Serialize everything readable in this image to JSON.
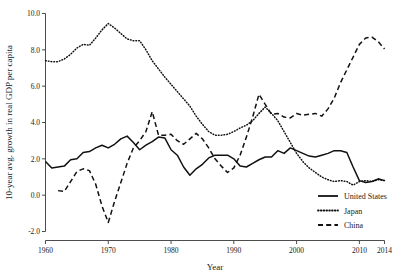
{
  "chart_data": {
    "type": "line",
    "title": "",
    "xlabel": "Year",
    "ylabel": "10-year avg. growth in real GDP per capita",
    "xlim": [
      1960,
      2014
    ],
    "ylim": [
      -2.0,
      10.0
    ],
    "grid": false,
    "legend_position": "bottom-right",
    "xticks": [
      1960,
      1970,
      1980,
      1990,
      2000,
      2010,
      2014
    ],
    "xticklabels": [
      "1960",
      "1970",
      "1980",
      "1990",
      "2000",
      "2010",
      "2014"
    ],
    "yticks": [
      -2.0,
      0.0,
      2.0,
      4.0,
      6.0,
      8.0,
      10.0
    ],
    "yticklabels": [
      "-2.0",
      "0.0",
      "2.0",
      "4.0",
      "6.0",
      "8.0",
      "10.0"
    ],
    "series": [
      {
        "name": "United States",
        "style": "solid",
        "color": "#111111",
        "x": [
          1960,
          1961,
          1962,
          1963,
          1964,
          1965,
          1966,
          1967,
          1968,
          1969,
          1970,
          1971,
          1972,
          1973,
          1974,
          1975,
          1976,
          1977,
          1978,
          1979,
          1980,
          1981,
          1982,
          1983,
          1984,
          1985,
          1986,
          1987,
          1988,
          1989,
          1990,
          1991,
          1992,
          1993,
          1994,
          1995,
          1996,
          1997,
          1998,
          1999,
          2000,
          2001,
          2002,
          2003,
          2004,
          2005,
          2006,
          2007,
          2008,
          2009,
          2010,
          2011,
          2012,
          2013,
          2014
        ],
        "values": [
          1.85,
          1.5,
          1.55,
          1.6,
          1.95,
          2.0,
          2.35,
          2.4,
          2.6,
          2.75,
          2.6,
          2.8,
          3.1,
          3.25,
          2.9,
          2.5,
          2.75,
          2.95,
          3.2,
          3.15,
          2.5,
          2.2,
          1.55,
          1.1,
          1.45,
          1.7,
          2.05,
          2.2,
          2.2,
          2.2,
          2.0,
          1.6,
          1.55,
          1.75,
          1.95,
          2.1,
          2.1,
          2.45,
          2.3,
          2.6,
          2.45,
          2.3,
          2.15,
          2.1,
          2.2,
          2.3,
          2.45,
          2.45,
          2.35,
          1.55,
          0.8,
          0.7,
          0.75,
          0.9,
          0.8
        ]
      },
      {
        "name": "Japan",
        "style": "dotted",
        "color": "#111111",
        "x": [
          1960,
          1961,
          1962,
          1963,
          1964,
          1965,
          1966,
          1967,
          1968,
          1969,
          1970,
          1971,
          1972,
          1973,
          1974,
          1975,
          1976,
          1977,
          1978,
          1979,
          1980,
          1981,
          1982,
          1983,
          1984,
          1985,
          1986,
          1987,
          1988,
          1989,
          1990,
          1991,
          1992,
          1993,
          1994,
          1995,
          1996,
          1997,
          1998,
          1999,
          2000,
          2001,
          2002,
          2003,
          2004,
          2005,
          2006,
          2007,
          2008,
          2009,
          2010,
          2011,
          2012,
          2013,
          2014
        ],
        "values": [
          7.4,
          7.35,
          7.35,
          7.5,
          7.75,
          8.1,
          8.3,
          8.25,
          8.65,
          9.1,
          9.45,
          9.2,
          8.9,
          8.6,
          8.5,
          8.5,
          8.0,
          7.4,
          6.95,
          6.5,
          6.1,
          5.7,
          5.3,
          4.9,
          4.35,
          3.9,
          3.5,
          3.3,
          3.3,
          3.35,
          3.5,
          3.7,
          3.85,
          4.1,
          4.5,
          4.85,
          4.5,
          4.1,
          3.5,
          2.9,
          2.3,
          1.85,
          1.5,
          1.25,
          1.0,
          0.85,
          0.75,
          0.8,
          0.75,
          0.55,
          0.75,
          0.8,
          0.75,
          0.85,
          0.8
        ]
      },
      {
        "name": "China",
        "style": "dashed",
        "color": "#111111",
        "x": [
          1962,
          1963,
          1964,
          1965,
          1966,
          1967,
          1968,
          1969,
          1970,
          1971,
          1972,
          1973,
          1974,
          1975,
          1976,
          1977,
          1978,
          1979,
          1980,
          1981,
          1982,
          1983,
          1984,
          1985,
          1986,
          1987,
          1988,
          1989,
          1990,
          1991,
          1992,
          1993,
          1994,
          1995,
          1996,
          1997,
          1998,
          1999,
          2000,
          2001,
          2002,
          2003,
          2004,
          2005,
          2006,
          2007,
          2008,
          2009,
          2010,
          2011,
          2012,
          2013,
          2014
        ],
        "values": [
          0.25,
          0.2,
          0.75,
          1.3,
          1.45,
          1.35,
          0.6,
          -0.6,
          -1.5,
          -0.35,
          0.7,
          1.75,
          2.6,
          3.0,
          3.5,
          4.6,
          3.3,
          3.3,
          3.35,
          3.0,
          2.8,
          3.1,
          3.4,
          3.1,
          2.6,
          2.0,
          1.6,
          1.25,
          1.5,
          2.2,
          3.2,
          4.3,
          5.55,
          5.0,
          4.45,
          4.5,
          4.3,
          4.25,
          4.5,
          4.4,
          4.45,
          4.5,
          4.35,
          4.75,
          5.35,
          6.2,
          6.9,
          7.6,
          8.3,
          8.65,
          8.7,
          8.45,
          8.05
        ]
      }
    ]
  },
  "legend": {
    "items": [
      {
        "label": "United States",
        "style": "solid"
      },
      {
        "label": "Japan",
        "style": "dotted"
      },
      {
        "label": "China",
        "style": "dashed"
      }
    ]
  }
}
